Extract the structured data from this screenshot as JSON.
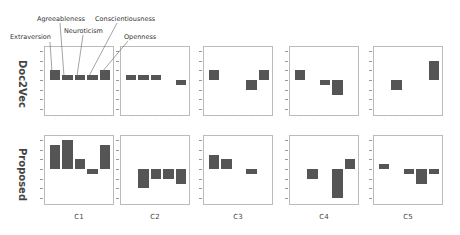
{
  "chart_data": {
    "type": "bar",
    "layout": "grid 2 rows x 5 columns of small-multiple bar charts",
    "rows": [
      "Doc2Vec",
      "Proposed"
    ],
    "columns": [
      "C1",
      "C2",
      "C3",
      "C4",
      "C5"
    ],
    "categories": [
      "Extraversion",
      "Agreeableness",
      "Neuroticism",
      "Conscientiousness",
      "Openness"
    ],
    "ylim": [
      -60,
      60
    ],
    "yticks": [
      60,
      40,
      20,
      0,
      -20,
      -40,
      -60
    ],
    "grid": false,
    "legend_position": "annotations above first panel with leader lines",
    "panels": [
      {
        "row": "Doc2Vec",
        "column": "C1",
        "values": [
          20,
          10,
          10,
          10,
          20
        ]
      },
      {
        "row": "Doc2Vec",
        "column": "C2",
        "values": [
          10,
          10,
          10,
          0,
          -10
        ]
      },
      {
        "row": "Doc2Vec",
        "column": "C3",
        "values": [
          20,
          0,
          0,
          -20,
          20
        ]
      },
      {
        "row": "Doc2Vec",
        "column": "C4",
        "values": [
          20,
          0,
          -10,
          -30,
          0
        ]
      },
      {
        "row": "Doc2Vec",
        "column": "C5",
        "values": [
          0,
          -20,
          0,
          0,
          40
        ]
      },
      {
        "row": "Proposed",
        "column": "C1",
        "values": [
          50,
          60,
          20,
          -10,
          50
        ]
      },
      {
        "row": "Proposed",
        "column": "C2",
        "values": [
          0,
          -40,
          -20,
          -20,
          -30
        ]
      },
      {
        "row": "Proposed",
        "column": "C3",
        "values": [
          30,
          20,
          0,
          -10,
          0
        ]
      },
      {
        "row": "Proposed",
        "column": "C4",
        "values": [
          0,
          -20,
          0,
          -60,
          20
        ]
      },
      {
        "row": "Proposed",
        "column": "C5",
        "values": [
          10,
          0,
          -10,
          -30,
          -10
        ]
      }
    ],
    "title": "",
    "xlabel": "",
    "ylabel": ""
  },
  "labels": {
    "legend": [
      "Extraversion",
      "Agreeableness",
      "Neuroticism",
      "Conscientiousness",
      "Openness"
    ],
    "rows": [
      "Doc2Vec",
      "Proposed"
    ],
    "columns": [
      "C1",
      "C2",
      "C3",
      "C4",
      "C5"
    ],
    "xticks": [
      "E",
      "A",
      "N",
      "C",
      "O"
    ]
  }
}
